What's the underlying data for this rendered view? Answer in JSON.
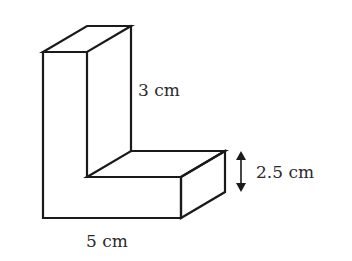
{
  "diagram": {
    "type": "3D L-shaped prism (isometric-style)",
    "labels": {
      "height": "3 cm",
      "thickness": "2.5 cm",
      "width": "5 cm"
    },
    "colors": {
      "stroke": "#1a1a1a",
      "text": "#2a2a2a",
      "background": "#ffffff"
    }
  }
}
